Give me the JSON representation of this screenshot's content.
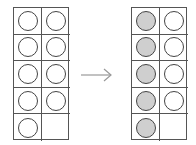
{
  "diagram": {
    "colors": {
      "grid_line": "#555555",
      "counter_outline": "#444444",
      "filled": "#cfcfcf",
      "empty": "#ffffff",
      "arrow": "#999999"
    },
    "left_frame": {
      "cells": [
        "empty",
        "empty",
        "empty",
        "empty",
        "empty",
        "empty",
        "empty",
        "empty",
        "empty",
        "none"
      ]
    },
    "arrow": {
      "icon": "arrow-right-icon"
    },
    "right_frame": {
      "cells": [
        "filled",
        "empty",
        "filled",
        "empty",
        "filled",
        "empty",
        "filled",
        "empty",
        "filled",
        "none"
      ]
    }
  }
}
